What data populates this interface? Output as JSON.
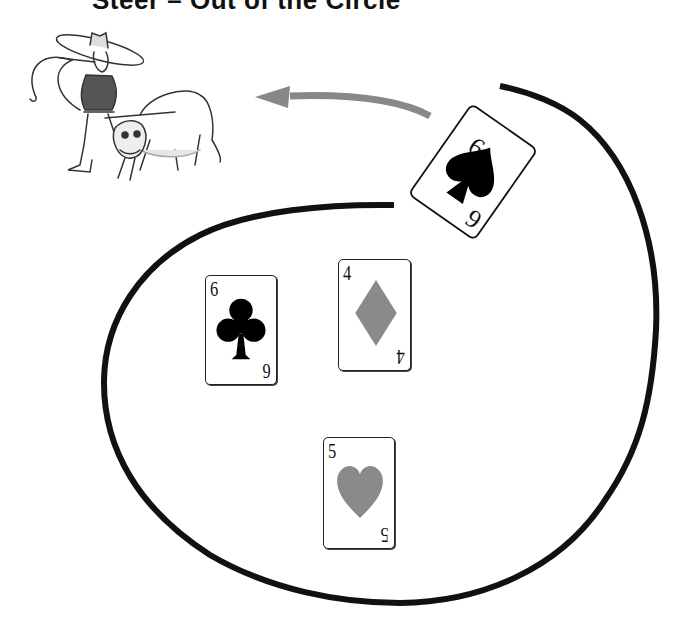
{
  "title": "Steer – Out of the Circle",
  "illustration": {
    "subject": "cowboy-roping-steer"
  },
  "arrow": {
    "direction": "left",
    "color": "#888888"
  },
  "circle": {
    "stroke_color": "#111111",
    "stroke_width": 6
  },
  "cards": [
    {
      "rank": "6",
      "suit": "spade",
      "suit_color": "#000000",
      "position": "outside-circle",
      "rotation_deg": -145
    },
    {
      "rank": "6",
      "suit": "club",
      "suit_color": "#000000",
      "position": "inside-circle"
    },
    {
      "rank": "4",
      "suit": "diamond",
      "suit_color": "#8a8a8a",
      "position": "inside-circle"
    },
    {
      "rank": "5",
      "suit": "heart",
      "suit_color": "#8a8a8a",
      "position": "inside-circle"
    }
  ]
}
